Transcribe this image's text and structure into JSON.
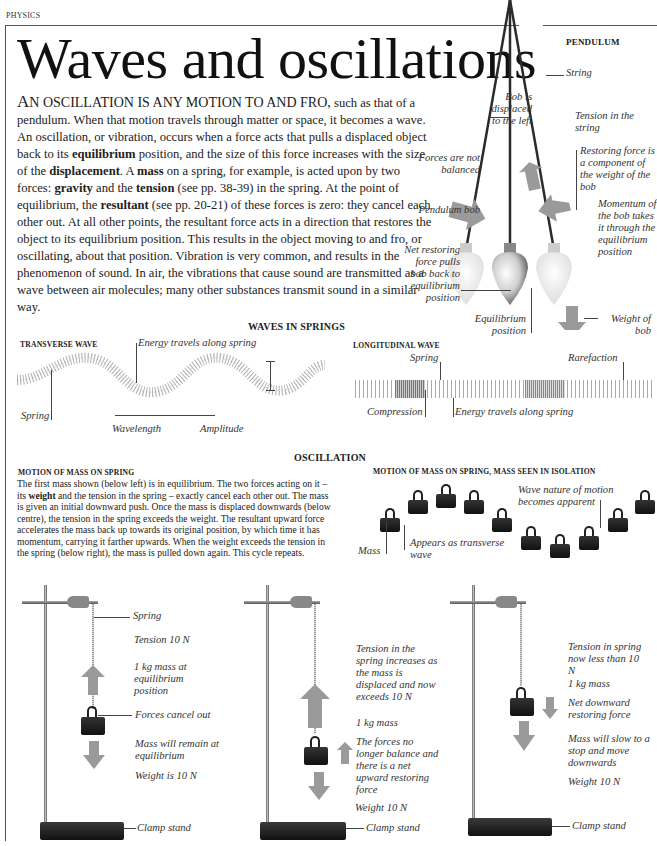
{
  "header": {
    "section": "PHYSICS",
    "title": "Waves and oscillations"
  },
  "intro": {
    "lead_first": "A",
    "lead_rest": "N OSCILLATION IS ANY MOTION TO AND FRO,",
    "p1": " such as that of a pendulum. When that motion travels through matter or space, it becomes a wave. An oscillation, or vibration, occurs when a force acts that pulls a displaced object back to its ",
    "b_equilibrium": "equilibrium",
    "p2": " position, and the size of this force increases with the size of the ",
    "b_displacement": "displacement",
    "p3": ". A ",
    "b_mass": "mass",
    "p4": " on a spring, for example, is acted upon by two forces: ",
    "b_gravity": "gravity",
    "p5": " and the ",
    "b_tension": "tension",
    "p6": " (see pp. 38-39) in the spring. At the point of equilibrium, the ",
    "b_resultant": "resultant",
    "p7": " (see pp. 20-21) of these forces is zero: they cancel each other out. At all other points, the resultant force acts in a direction that restores the object to its equilibrium position. This results in the object moving to and fro, or oscillating, about that position. Vibration is very common, and results in the phenomenon of sound. In air, the vibrations that cause sound are transmitted as a wave between air molecules; many other substances transmit sound in a similar way."
  },
  "pendulum": {
    "heading": "PENDULUM",
    "labels": {
      "string": "String",
      "bob_displaced": "Bob is displaced to the left",
      "tension_in_string": "Tension in the string",
      "restoring_force": "Restoring force is a component of the weight of the bob",
      "forces_not_balanced": "Forces are not balanced",
      "pendulum_bob": "Pendulum bob",
      "momentum": "Momentum of the bob takes it through the equilibrium position",
      "net_restoring": "Net restoring force pulls bob back to equilibrium position",
      "equilibrium_position": "Equilibrium position",
      "weight_of_bob": "Weight of bob"
    },
    "arrow_color": "#9a9a9a"
  },
  "waves_in_springs": {
    "heading": "WAVES IN SPRINGS",
    "transverse": {
      "heading": "TRANSVERSE WAVE",
      "energy": "Energy travels along spring",
      "spring": "Spring",
      "wavelength": "Wavelength",
      "amplitude": "Amplitude"
    },
    "longitudinal": {
      "heading": "LONGITUDINAL WAVE",
      "spring": "Spring",
      "rarefaction": "Rarefaction",
      "compression": "Compression",
      "energy": "Energy  travels along spring"
    }
  },
  "oscillation": {
    "heading": "OSCILLATION",
    "motion_heading": "MOTION OF MASS ON SPRING",
    "text_a": "The first mass shown (below left) is in equilibrium. The two forces acting on it – its ",
    "text_bold": "weight",
    "text_b": " and the tension in the spring – exactly cancel each other out. The mass is given an initial downward push. Once the mass is displaced downwards (below centre), the tension in the spring exceeds the weight. The resultant upward force accelerates the mass back up towards its original position, by which time it has momentum, carrying it farther upwards. When the weight exceeds the tension in the spring (below right), the mass is pulled down again. This cycle repeats.",
    "isolation_heading": "MOTION OF MASS ON SPRING, MASS SEEN IN ISOLATION",
    "isolation_labels": {
      "mass": "Mass",
      "appears": "Appears as transverse wave",
      "wave_nature": "Wave nature of motion becomes apparent"
    },
    "isolation_mass_offsets": [
      0,
      -18,
      -24,
      -18,
      0,
      18,
      26,
      18,
      0,
      -18,
      -24
    ]
  },
  "stands": [
    {
      "labels": {
        "spring": "Spring",
        "tension": "Tension 10 N",
        "mass": "1 kg mass at equilibrium position",
        "forces": "Forces cancel out",
        "remain": "Mass will remain at equilibrium",
        "weight": "Weight is 10 N",
        "clamp": "Clamp stand"
      }
    },
    {
      "labels": {
        "tension": "Tension in the spring increases as the mass is displaced and now exceeds 10 N",
        "mass": "1 kg mass",
        "forces": "The forces no longer balance and there is a net upward restoring force",
        "weight": "Weight 10 N",
        "clamp": "Clamp stand"
      }
    },
    {
      "labels": {
        "tension": "Tension in spring now less than 10 N",
        "mass": "1 kg mass",
        "net": "Net downward restoring force",
        "slow": "Mass will slow to a stop and move downwards",
        "weight": "Weight 10 N",
        "clamp": "Clamp stand"
      }
    }
  ]
}
